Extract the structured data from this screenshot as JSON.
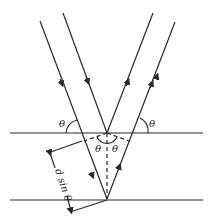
{
  "diagram": {
    "labels": {
      "theta_upper_left": "θ",
      "theta_upper_right": "θ",
      "theta_inner_left": "θ",
      "theta_inner_right": "θ",
      "path_difference": "d sin θ"
    },
    "colors": {
      "line": "#2a2a2a",
      "background": "#ffffff"
    }
  }
}
